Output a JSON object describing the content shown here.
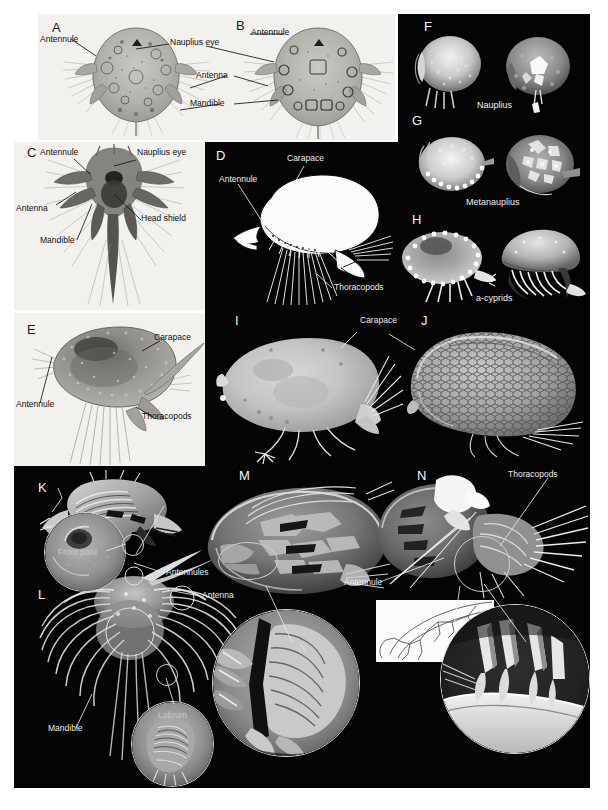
{
  "figure": {
    "background_color": "#ffffff",
    "dark_panel_color": "#040404",
    "light_panel_color": "#f2f1ee"
  },
  "panels": [
    {
      "id": "A",
      "letter": "A",
      "tone": "light",
      "labels": [
        "Antennule",
        "Nauplius eye",
        "Antenna",
        "Mandible"
      ]
    },
    {
      "id": "B",
      "letter": "B",
      "tone": "light",
      "labels": [
        "Antennule"
      ]
    },
    {
      "id": "C",
      "letter": "C",
      "tone": "light",
      "labels": [
        "Antennule",
        "Nauplius eye",
        "Antenna",
        "Head shield",
        "Mandible"
      ]
    },
    {
      "id": "D",
      "letter": "D",
      "tone": "dark",
      "labels": [
        "Carapace",
        "Antennule",
        "Thoracopods"
      ]
    },
    {
      "id": "E",
      "letter": "E",
      "tone": "light",
      "labels": [
        "Carapace",
        "Antennule",
        "Thoracopods"
      ]
    },
    {
      "id": "F",
      "letter": "F",
      "tone": "dark",
      "stage_caption": "Nauplius"
    },
    {
      "id": "G",
      "letter": "G",
      "tone": "dark",
      "stage_caption": "Metanauplius"
    },
    {
      "id": "H",
      "letter": "H",
      "tone": "dark",
      "stage_caption": "a-cyprids"
    },
    {
      "id": "I",
      "letter": "I",
      "tone": "dark",
      "labels": [
        "Carapace"
      ]
    },
    {
      "id": "J",
      "letter": "J",
      "tone": "dark",
      "labels": [
        "Thoracopods"
      ]
    },
    {
      "id": "K",
      "letter": "K",
      "tone": "dark",
      "labels": [
        "Front pore"
      ]
    },
    {
      "id": "L",
      "letter": "L",
      "tone": "dark",
      "labels": [
        "Antennules",
        "Antenna",
        "Mandible",
        "Labrum"
      ]
    },
    {
      "id": "M",
      "letter": "M",
      "tone": "dark",
      "labels": []
    },
    {
      "id": "N",
      "letter": "N",
      "tone": "dark",
      "labels": [
        "Thoracopods",
        "Antennule"
      ]
    }
  ],
  "letters": {
    "A": "A",
    "B": "B",
    "C": "C",
    "D": "D",
    "E": "E",
    "F": "F",
    "G": "G",
    "H": "H",
    "I": "I",
    "J": "J",
    "K": "K",
    "L": "L",
    "M": "M",
    "N": "N"
  },
  "annotations": {
    "a_antennule": "Antennule",
    "a_nauplius_eye": "Nauplius eye",
    "a_antenna": "Antenna",
    "a_mandible": "Mandible",
    "b_antennule": "Antennule",
    "c_antennule": "Antennule",
    "c_nauplius_eye": "Nauplius eye",
    "c_antenna": "Antenna",
    "c_head_shield": "Head shield",
    "c_mandible": "Mandible",
    "d_carapace": "Carapace",
    "d_antennule": "Antennule",
    "d_thoracopods": "Thoracopods",
    "e_carapace": "Carapace",
    "e_antennule": "Antennule",
    "e_thoracopods": "Thoracopods",
    "f_nauplius": "Nauplius",
    "g_metanauplius": "Metanauplius",
    "h_acyprids": "a-cyprids",
    "i_carapace": "Carapace",
    "j_thoracopods": "Thoracopods",
    "k_front_pore": "Front pore",
    "l_antennules": "Antennules",
    "l_antenna": "Antenna",
    "l_mandible": "Mandible",
    "l_labrum": "Labrum",
    "n_thoracopods": "Thoracopods",
    "n_antennule": "Antennule"
  }
}
